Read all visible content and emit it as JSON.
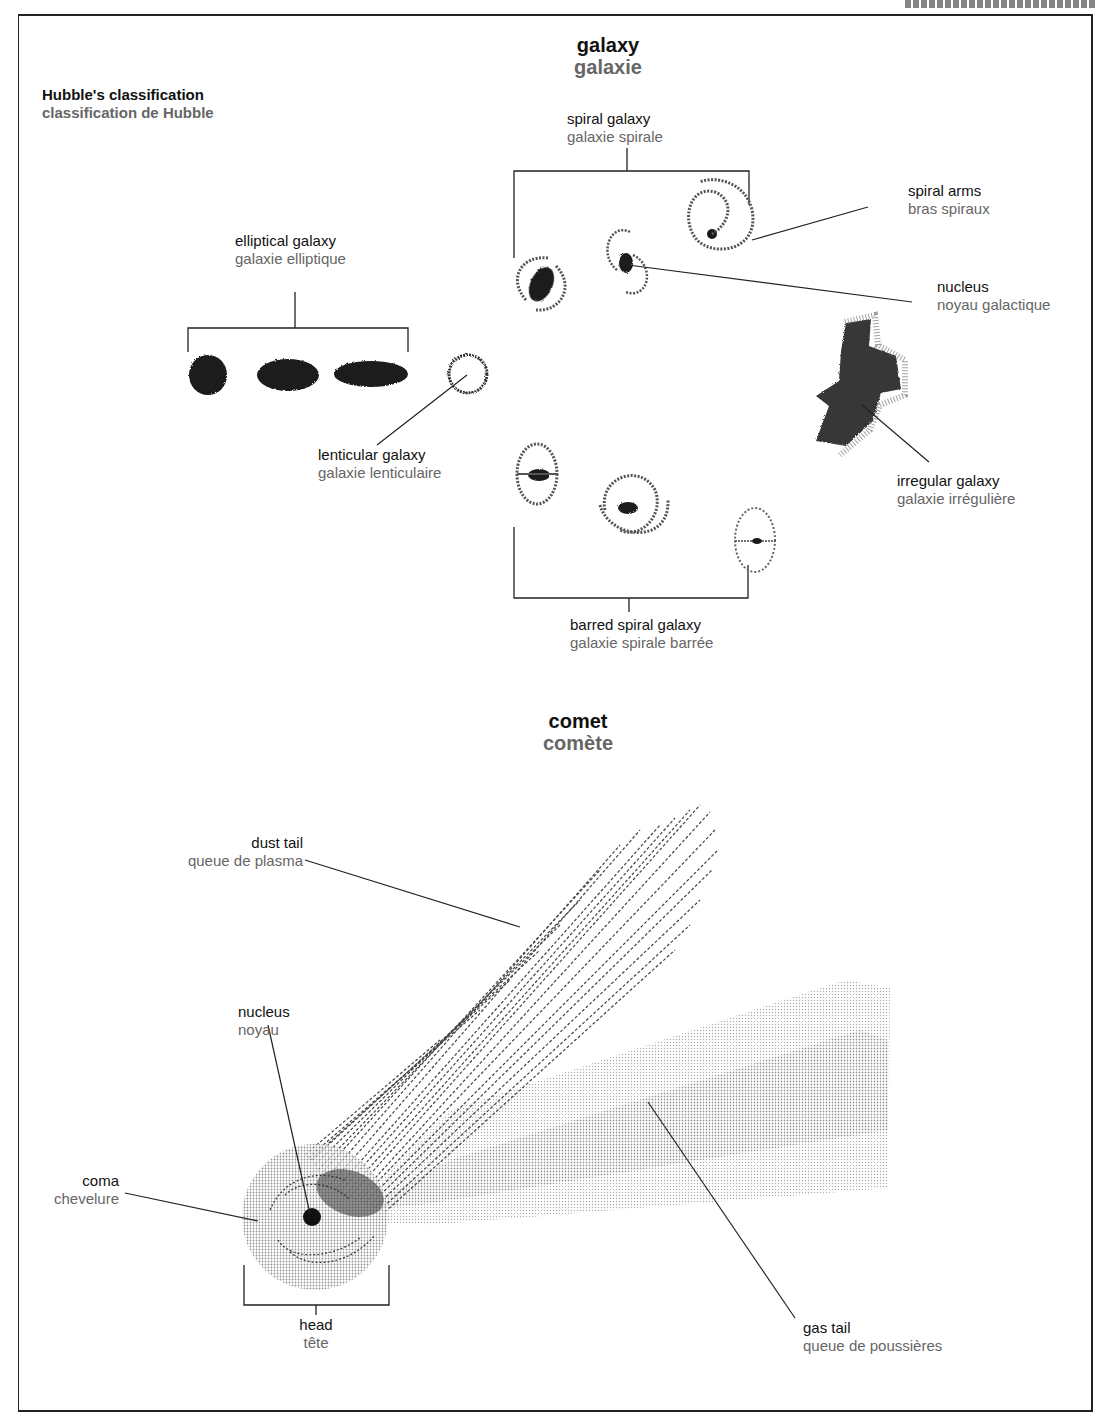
{
  "page": {
    "header_fragment": "ASTRONOMIE"
  },
  "galaxy": {
    "title_en": "galaxy",
    "title_fr": "galaxie",
    "hubble_en": "Hubble's classification",
    "hubble_fr": "classification de Hubble",
    "labels": {
      "elliptical": {
        "en": "elliptical galaxy",
        "fr": "galaxie elliptique"
      },
      "lenticular": {
        "en": "lenticular galaxy",
        "fr": "galaxie lenticulaire"
      },
      "spiral": {
        "en": "spiral galaxy",
        "fr": "galaxie spirale"
      },
      "spiral_arms": {
        "en": "spiral arms",
        "fr": "bras spiraux"
      },
      "nucleus": {
        "en": "nucleus",
        "fr": "noyau galactique"
      },
      "irregular": {
        "en": "irregular galaxy",
        "fr": "galaxie irrégulière"
      },
      "barred_spiral": {
        "en": "barred spiral galaxy",
        "fr": "galaxie spirale barrée"
      }
    }
  },
  "comet": {
    "title_en": "comet",
    "title_fr": "comète",
    "labels": {
      "dust_tail": {
        "en": "dust tail",
        "fr": "queue de plasma"
      },
      "nucleus": {
        "en": "nucleus",
        "fr": "noyau"
      },
      "coma": {
        "en": "coma",
        "fr": "chevelure"
      },
      "head": {
        "en": "head",
        "fr": "tête"
      },
      "gas_tail": {
        "en": "gas tail",
        "fr": "queue de poussières"
      }
    }
  },
  "colors": {
    "ink": "#111111",
    "secondary_text": "#666666",
    "frame": "#222222",
    "coma_fill": "#c8c8c8",
    "gas_tail_light": "#e2e2e2",
    "gas_tail_mid": "#cfcfcf"
  }
}
